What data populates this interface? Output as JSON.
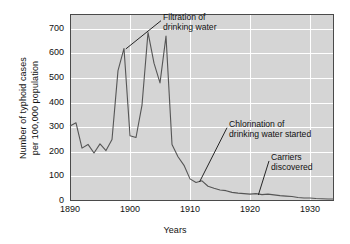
{
  "chart_data": {
    "type": "line",
    "title": "",
    "xlabel": "Years",
    "ylabel_line1": "Number of typhoid cases",
    "ylabel_line2": "per 100,000 population",
    "xlim": [
      1890,
      1934
    ],
    "ylim": [
      0,
      760
    ],
    "grid": true,
    "legend": "none",
    "xticks": [
      1890,
      1900,
      1910,
      1920,
      1930
    ],
    "xtick_labels": [
      "1890",
      "1900",
      "1910",
      "1920",
      "1930"
    ],
    "yticks": [
      0,
      100,
      200,
      300,
      400,
      500,
      600,
      700
    ],
    "ytick_labels": [
      "0",
      "100",
      "200",
      "300",
      "400",
      "500",
      "600",
      "700"
    ],
    "series": [
      {
        "name": "Typhoid cases per 100,000 population",
        "color": "#555555",
        "x": [
          1890,
          1891,
          1892,
          1893,
          1894,
          1895,
          1896,
          1897,
          1898,
          1899,
          1900,
          1901,
          1902,
          1903,
          1904,
          1905,
          1906,
          1907,
          1908,
          1909,
          1910,
          1911,
          1912,
          1913,
          1914,
          1915,
          1916,
          1917,
          1918,
          1919,
          1920,
          1921,
          1922,
          1923,
          1924,
          1925,
          1926,
          1927,
          1928,
          1929,
          1930,
          1931,
          1932,
          1933,
          1934
        ],
        "values": [
          305,
          318,
          215,
          230,
          195,
          232,
          205,
          250,
          530,
          620,
          265,
          258,
          390,
          685,
          560,
          480,
          670,
          230,
          180,
          145,
          90,
          75,
          82,
          60,
          52,
          45,
          42,
          35,
          32,
          30,
          28,
          30,
          26,
          28,
          25,
          22,
          20,
          18,
          14,
          12,
          12,
          10,
          9,
          8,
          8
        ]
      }
    ],
    "annotations": [
      {
        "id": "filtration",
        "text_line1": "Filtration of",
        "text_line2": "drinking water",
        "text_x": 1905.5,
        "text_y": 745,
        "point_x": 1899.3,
        "point_y": 618
      },
      {
        "id": "chlorination",
        "text_line1": "Chlorination of",
        "text_line2": "drinking water started",
        "text_x": 1916.5,
        "text_y": 310,
        "point_x": 1911.6,
        "point_y": 78
      },
      {
        "id": "carriers",
        "text_line1": "Carriers",
        "text_line2": "discovered",
        "text_x": 1923.5,
        "text_y": 175,
        "point_x": 1921.4,
        "point_y": 25
      }
    ]
  },
  "colors": {
    "plot_background": "#d5d5d5",
    "grid": "#ffffff",
    "axis_border": "#4a4a4a",
    "line": "#555555",
    "text": "#111111",
    "page_background": "#ffffff"
  }
}
